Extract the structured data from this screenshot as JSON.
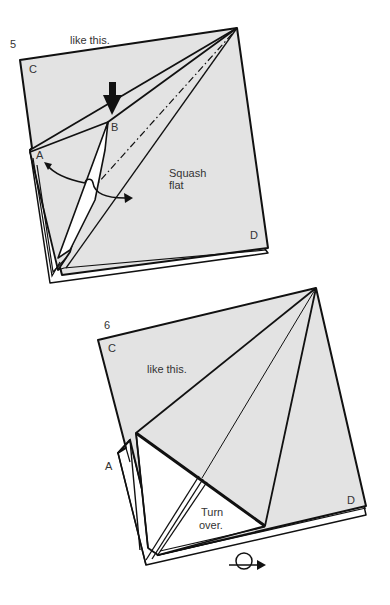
{
  "step5": {
    "number": "5",
    "caption": "like this.",
    "labels": {
      "c": "C",
      "b": "B",
      "a": "A",
      "d": "D"
    },
    "instruction_line1": "Squash",
    "instruction_line2": "flat",
    "icons": [
      "push-down-arrow-icon",
      "swing-arrow-icon",
      "valley-fold-line"
    ]
  },
  "step6": {
    "number": "6",
    "caption": "like this.",
    "labels": {
      "c": "C",
      "a": "A",
      "d": "D"
    },
    "instruction_line1": "Turn",
    "instruction_line2": "over.",
    "icons": [
      "turn-over-icon"
    ]
  },
  "colors": {
    "paper": "#e3e3e3",
    "paper_white": "#ffffff",
    "line": "#111111",
    "text": "#333333"
  }
}
